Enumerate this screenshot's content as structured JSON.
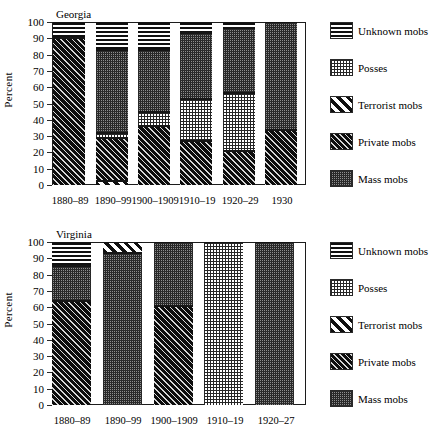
{
  "figure": {
    "ylabel": "Percent",
    "y_ticks": [
      "100",
      "90",
      "80",
      "70",
      "60",
      "50",
      "40",
      "30",
      "20",
      "10",
      "0"
    ],
    "legend_labels": {
      "unknown": "Unknown mobs",
      "posses": "Posses",
      "terrorist": "Terrorist mobs",
      "private": "Private mobs",
      "mass": "Mass mobs"
    }
  },
  "chart_data": [
    {
      "type": "bar",
      "subtype": "stacked-bar-100pct",
      "title": "Georgia",
      "xlabel": "",
      "ylabel": "Percent",
      "ylim": [
        0,
        100
      ],
      "ytick_interval": 10,
      "grid": false,
      "legend_position": "right",
      "categories": [
        "1880–89",
        "1890–99",
        "1900–1909",
        "1910–19",
        "1920–29",
        "1930"
      ],
      "series": [
        {
          "name": "Private mobs",
          "key": "private",
          "values": [
            90.5,
            26.5,
            36.5,
            27,
            21,
            33.5
          ]
        },
        {
          "name": "Posses",
          "key": "posses",
          "values": [
            0,
            3,
            8,
            26,
            35.5,
            0
          ]
        },
        {
          "name": "Terrorist mobs",
          "key": "terrorist",
          "values": [
            0,
            2.5,
            0,
            0,
            0,
            0
          ]
        },
        {
          "name": "Mass mobs",
          "key": "mass",
          "values": [
            0,
            51,
            38.5,
            40,
            40,
            66.5
          ]
        },
        {
          "name": "Unknown mobs",
          "key": "unknown",
          "values": [
            9.5,
            17,
            17,
            7,
            3.5,
            0
          ]
        }
      ],
      "stack_order_bottom_to_top": [
        "terrorist",
        "private",
        "posses",
        "mass",
        "unknown"
      ]
    },
    {
      "type": "bar",
      "subtype": "stacked-bar-100pct",
      "title": "Virginia",
      "xlabel": "",
      "ylabel": "Percent",
      "ylim": [
        0,
        100
      ],
      "ytick_interval": 10,
      "grid": false,
      "legend_position": "right",
      "categories": [
        "1880–89",
        "1890–99",
        "1900–1909",
        "1910–19",
        "1920–27"
      ],
      "series": [
        {
          "name": "Private mobs",
          "key": "private",
          "values": [
            64,
            0,
            61,
            0,
            0
          ]
        },
        {
          "name": "Posses",
          "key": "posses",
          "values": [
            0,
            0,
            0,
            100,
            0
          ]
        },
        {
          "name": "Terrorist mobs",
          "key": "terrorist",
          "values": [
            0,
            7,
            0,
            0,
            0
          ]
        },
        {
          "name": "Mass mobs",
          "key": "mass",
          "values": [
            21,
            93,
            39,
            0,
            100
          ]
        },
        {
          "name": "Unknown mobs",
          "key": "unknown",
          "values": [
            15,
            0,
            0,
            0,
            0
          ]
        }
      ],
      "stack_order_bottom_to_top": [
        "private",
        "posses",
        "mass",
        "terrorist",
        "unknown"
      ]
    }
  ]
}
